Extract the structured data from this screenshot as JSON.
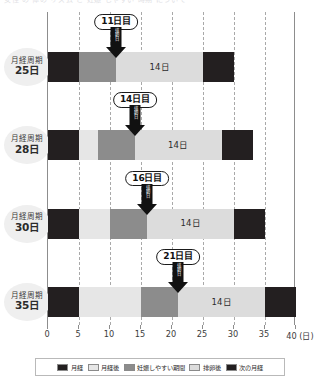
{
  "top_bleed_text": "女性 の 体の リズム と 妊娠 しやすい 時期 について",
  "colors": {
    "menstruation": "#231f20",
    "post_menstruation": "#e6e6e6",
    "fertile_window": "#8c8c8c",
    "post_ovulation": "#dcdcdc",
    "next_menstruation": "#231f20",
    "grid": "#a9a9a9",
    "axis": "#8d8d8d",
    "label_bubble_bg": "#efefef"
  },
  "axis": {
    "min": 0,
    "max": 40,
    "ticks": [
      0,
      5,
      10,
      15,
      20,
      25,
      30,
      35,
      40
    ],
    "tick_labels": [
      "0",
      "5",
      "10",
      "15",
      "20",
      "25",
      "30",
      "35",
      "40"
    ],
    "unit_suffix": "(日)",
    "last_tick_label": "40 (日)",
    "gridlines": [
      5,
      10,
      15,
      20,
      25,
      30,
      35
    ]
  },
  "legend": {
    "items": [
      {
        "label": "月経",
        "color": "#231f20",
        "key": "menstruation"
      },
      {
        "label": "月経後",
        "color": "#e6e6e6",
        "key": "post_menstruation"
      },
      {
        "label": "妊娠しやすい期間",
        "color": "#8c8c8c",
        "key": "fertile_window"
      },
      {
        "label": "排卵後",
        "color": "#dcdcdc",
        "key": "post_ovulation"
      },
      {
        "label": "次の月経",
        "color": "#231f20",
        "key": "next_menstruation"
      }
    ]
  },
  "chart_data": {
    "type": "bar",
    "orientation": "horizontal",
    "stacked": true,
    "title": "",
    "xlabel": "(日)",
    "ylabel": "",
    "xlim": [
      0,
      40
    ],
    "grid": true,
    "legend_position": "bottom",
    "categories": [
      "月経周期25日",
      "月経周期28日",
      "月経周期30日",
      "月経周期35日"
    ],
    "rows": [
      {
        "label_line1": "月経周期",
        "label_line2": "25日",
        "cycle_length": 25,
        "ovulation_day": 11,
        "callout_label": "11日目",
        "callout_vertical_text": "排卵日",
        "luteal_label": "14日",
        "segments": [
          {
            "key": "menstruation",
            "start": 0,
            "end": 5,
            "color": "#231f20",
            "label": ""
          },
          {
            "key": "fertile_window",
            "start": 5,
            "end": 11,
            "color": "#8c8c8c",
            "label": ""
          },
          {
            "key": "post_ovulation",
            "start": 11,
            "end": 25,
            "color": "#dcdcdc",
            "label": "14日"
          },
          {
            "key": "next_menstruation",
            "start": 25,
            "end": 30,
            "color": "#231f20",
            "label": ""
          }
        ]
      },
      {
        "label_line1": "月経周期",
        "label_line2": "28日",
        "cycle_length": 28,
        "ovulation_day": 14,
        "callout_label": "14日目",
        "callout_vertical_text": "排卵日",
        "luteal_label": "14日",
        "segments": [
          {
            "key": "menstruation",
            "start": 0,
            "end": 5,
            "color": "#231f20",
            "label": ""
          },
          {
            "key": "post_menstruation",
            "start": 5,
            "end": 8,
            "color": "#e6e6e6",
            "label": ""
          },
          {
            "key": "fertile_window",
            "start": 8,
            "end": 14,
            "color": "#8c8c8c",
            "label": ""
          },
          {
            "key": "post_ovulation",
            "start": 14,
            "end": 28,
            "color": "#dcdcdc",
            "label": "14日"
          },
          {
            "key": "next_menstruation",
            "start": 28,
            "end": 33,
            "color": "#231f20",
            "label": ""
          }
        ]
      },
      {
        "label_line1": "月経周期",
        "label_line2": "30日",
        "cycle_length": 30,
        "ovulation_day": 16,
        "callout_label": "16日目",
        "callout_vertical_text": "排卵日",
        "luteal_label": "14日",
        "segments": [
          {
            "key": "menstruation",
            "start": 0,
            "end": 5,
            "color": "#231f20",
            "label": ""
          },
          {
            "key": "post_menstruation",
            "start": 5,
            "end": 10,
            "color": "#e6e6e6",
            "label": ""
          },
          {
            "key": "fertile_window",
            "start": 10,
            "end": 16,
            "color": "#8c8c8c",
            "label": ""
          },
          {
            "key": "post_ovulation",
            "start": 16,
            "end": 30,
            "color": "#dcdcdc",
            "label": "14日"
          },
          {
            "key": "next_menstruation",
            "start": 30,
            "end": 35,
            "color": "#231f20",
            "label": ""
          }
        ]
      },
      {
        "label_line1": "月経周期",
        "label_line2": "35日",
        "cycle_length": 35,
        "ovulation_day": 21,
        "callout_label": "21日目",
        "callout_vertical_text": "排卵日",
        "luteal_label": "14日",
        "segments": [
          {
            "key": "menstruation",
            "start": 0,
            "end": 5,
            "color": "#231f20",
            "label": ""
          },
          {
            "key": "post_menstruation",
            "start": 5,
            "end": 15,
            "color": "#e6e6e6",
            "label": ""
          },
          {
            "key": "fertile_window",
            "start": 15,
            "end": 21,
            "color": "#8c8c8c",
            "label": ""
          },
          {
            "key": "post_ovulation",
            "start": 21,
            "end": 35,
            "color": "#dcdcdc",
            "label": "14日"
          },
          {
            "key": "next_menstruation",
            "start": 35,
            "end": 40,
            "color": "#231f20",
            "label": ""
          }
        ]
      }
    ]
  }
}
